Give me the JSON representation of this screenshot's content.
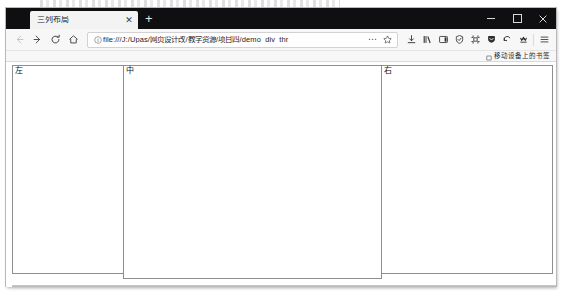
{
  "window": {
    "controls": {
      "minimize": "−",
      "maximize": "□",
      "close": "✕"
    }
  },
  "tabs": {
    "items": [
      {
        "title": "三列布局",
        "close_label": "✕",
        "active": true
      }
    ],
    "new_tab_label": "+"
  },
  "navigation": {
    "back_label": "←",
    "forward_label": "→",
    "reload_label": "⟳",
    "home_label": "⌂"
  },
  "urlbar": {
    "value": "file:///J:/Upas/网页设计改/教学资源/项目四/demo_div_thr",
    "placeholder": "搜索或输入网址",
    "page_actions_label": "⋯",
    "bookmark_label": "☆",
    "identity_icon": "info-icon"
  },
  "toolbar": {
    "icons": [
      {
        "name": "downloads-icon",
        "label": "下载"
      },
      {
        "name": "library-icon",
        "label": "书库"
      },
      {
        "name": "sidebar-icon",
        "label": "侧边栏"
      },
      {
        "name": "shield-icon",
        "label": "保护"
      },
      {
        "name": "screenshot-icon",
        "label": "截图"
      },
      {
        "name": "pocket-icon",
        "label": "Pocket"
      },
      {
        "name": "sync-icon",
        "label": "同步"
      },
      {
        "name": "account-icon",
        "label": "账户"
      },
      {
        "name": "menu-icon",
        "label": "菜单"
      }
    ]
  },
  "bookmarks_bar": {
    "items": [
      {
        "label": "移动设备上的书签",
        "icon": "folder-icon"
      }
    ]
  },
  "page": {
    "title": "三列布局",
    "columns": [
      {
        "id": "left",
        "label": "左"
      },
      {
        "id": "middle",
        "label": "中"
      },
      {
        "id": "right",
        "label": "右"
      }
    ]
  }
}
